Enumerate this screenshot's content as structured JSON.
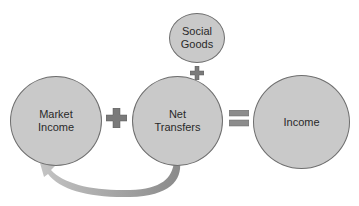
{
  "diagram": {
    "nodes": [
      {
        "id": "market_income",
        "label": "Market\nIncome"
      },
      {
        "id": "net_transfers",
        "label": "Net\nTransfers"
      },
      {
        "id": "income",
        "label": "Income"
      },
      {
        "id": "social_goods",
        "label": "Social\nGoods"
      }
    ],
    "operators": [
      {
        "id": "plus_market_net",
        "symbol": "+",
        "icon": "plus-icon"
      },
      {
        "id": "plus_social_net",
        "symbol": "+",
        "icon": "plus-icon"
      },
      {
        "id": "equals_net_income",
        "symbol": "=",
        "icon": "equals-icon"
      }
    ],
    "arrows": [
      {
        "from": "net_transfers",
        "to": "market_income",
        "style": "curved",
        "icon": "curved-arrow-icon"
      }
    ],
    "colors": {
      "node_fill": "#c9c9c9",
      "node_border": "#6e6e6e",
      "operator_fill": "#7a7a7a",
      "arrow_fill": "#a8a8a8"
    }
  }
}
